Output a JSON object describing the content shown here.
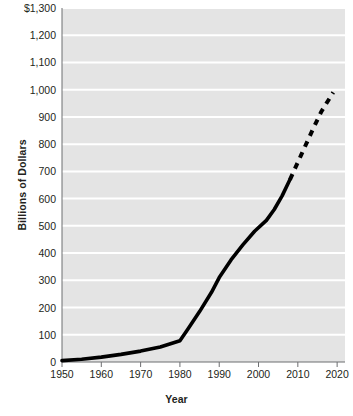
{
  "chart_data": {
    "type": "line",
    "title": "",
    "xlabel": "Year",
    "ylabel": "Billions of Dollars",
    "xlim": [
      1950,
      2022
    ],
    "ylim": [
      0,
      1300
    ],
    "grid": "horizontal",
    "legend": "none",
    "x_tick_labels": [
      "1950",
      "1960",
      "1970",
      "1980",
      "1990",
      "2000",
      "2010",
      "2020"
    ],
    "x_ticks": [
      1950,
      1960,
      1970,
      1980,
      1990,
      2000,
      2010,
      2020
    ],
    "y_tick_labels": [
      "$1,300",
      "1,200",
      "1,100",
      "1,000",
      "900",
      "800",
      "700",
      "600",
      "500",
      "400",
      "300",
      "200",
      "100",
      "0"
    ],
    "y_ticks": [
      1300,
      1200,
      1100,
      1000,
      900,
      800,
      700,
      600,
      500,
      400,
      300,
      200,
      100,
      0
    ],
    "series": [
      {
        "name": "actual",
        "style": "solid",
        "color": "#000000",
        "x": [
          1950,
          1955,
          1960,
          1965,
          1970,
          1975,
          1980,
          1982,
          1985,
          1988,
          1990,
          1993,
          1996,
          1999,
          2002,
          2004,
          2006,
          2008
        ],
        "values": [
          5,
          10,
          18,
          28,
          40,
          55,
          78,
          120,
          185,
          255,
          310,
          375,
          430,
          480,
          520,
          560,
          610,
          670
        ]
      },
      {
        "name": "projected",
        "style": "dashed",
        "color": "#000000",
        "x": [
          2008,
          2011,
          2014,
          2016,
          2019
        ],
        "values": [
          670,
          765,
          860,
          920,
          990
        ]
      }
    ]
  },
  "axes": {
    "y_title": "Billions of Dollars",
    "x_title": "Year"
  },
  "colors": {
    "plot_background": "#e4e4e4",
    "gridline": "#ffffff",
    "line": "#000000",
    "axis": "#6d6e71",
    "text": "#231f20",
    "page_background": "#ffffff"
  }
}
